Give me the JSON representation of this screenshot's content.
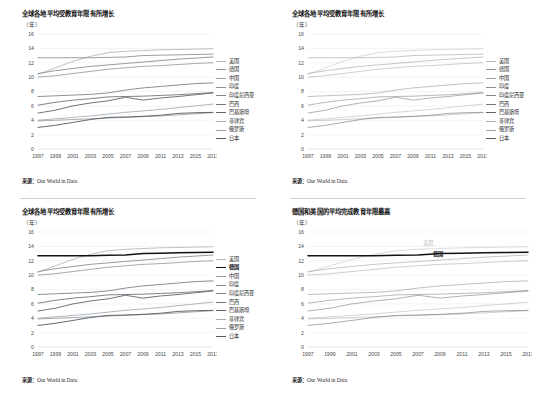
{
  "page": {
    "background": "#ffffff",
    "divider_color": "#c9cfd6"
  },
  "common": {
    "unit": "（年）",
    "source_label": "来源：",
    "source_text": "Our World in Data",
    "axis_ticks_y": [
      "16",
      "14",
      "12",
      "10",
      "8",
      "6",
      "4",
      "2",
      "0"
    ],
    "axis_ticks_x": [
      "1997",
      "1999",
      "2001",
      "2003",
      "2005",
      "2007",
      "2009",
      "2011",
      "2013",
      "2015",
      "2017"
    ]
  },
  "panels": [
    {
      "id": "panel-top-left",
      "title": "全球各地平均受教育年限有所增长",
      "legend_position": "right",
      "highlight": null
    },
    {
      "id": "panel-top-right",
      "title": "全球各地平均受教育年限有所增长",
      "legend_position": "right",
      "highlight": null
    },
    {
      "id": "panel-bottom-left",
      "title": "全球各地平均受教育年限有所增长",
      "legend_position": "right",
      "highlight": "德国"
    },
    {
      "id": "panel-bottom-right",
      "title": "德国和美国的平均完成教育年限最高",
      "legend_position": "inline",
      "highlight": "德国",
      "inline_labels": [
        {
          "name": "美国",
          "color": "#b9bec4"
        },
        {
          "name": "德国",
          "color": "#1a1a1a"
        }
      ]
    }
  ],
  "chart_data": {
    "type": "line",
    "title": "全球各地平均受教育年限有所增长",
    "subtitle": "德国和美国的平均完成教育年限最高",
    "xlabel": "",
    "ylabel": "（年）",
    "ylim": [
      0,
      16
    ],
    "xlim": [
      1997,
      2017
    ],
    "grid": true,
    "legend_position": "right",
    "x": [
      1997,
      1999,
      2001,
      2003,
      2005,
      2007,
      2009,
      2011,
      2013,
      2015,
      2017
    ],
    "series": [
      {
        "name": "美国",
        "color": "#b4b9bf",
        "values": [
          10.4,
          11.3,
          12.2,
          12.9,
          13.4,
          13.6,
          13.7,
          13.8,
          13.85,
          13.9,
          13.95
        ]
      },
      {
        "name": "德国",
        "color": "#8d949b",
        "values": [
          12.7,
          12.7,
          12.7,
          12.7,
          12.75,
          12.8,
          13.0,
          13.05,
          13.1,
          13.15,
          13.2
        ]
      },
      {
        "name": "中国",
        "color": "#9aa0a6",
        "values": [
          10.0,
          10.2,
          10.5,
          10.8,
          11.1,
          11.3,
          11.5,
          11.6,
          11.75,
          11.9,
          12.0
        ]
      },
      {
        "name": "印度",
        "color": "#8a9096",
        "values": [
          10.5,
          10.9,
          11.2,
          11.5,
          11.7,
          11.9,
          12.1,
          12.3,
          12.5,
          12.65,
          12.8
        ]
      },
      {
        "name": "印度尼西亚",
        "color": "#7d838a",
        "values": [
          7.3,
          7.4,
          7.5,
          7.6,
          7.8,
          8.2,
          8.5,
          8.7,
          8.9,
          9.1,
          9.2
        ]
      },
      {
        "name": "巴西",
        "color": "#6f757c",
        "values": [
          6.1,
          6.5,
          6.8,
          7.0,
          7.25,
          7.3,
          7.35,
          7.45,
          7.55,
          7.7,
          7.85
        ]
      },
      {
        "name": "巴基斯坦",
        "color": "#60666d",
        "values": [
          5.0,
          5.4,
          6.0,
          6.4,
          6.7,
          7.2,
          6.8,
          7.1,
          7.3,
          7.55,
          7.8
        ]
      },
      {
        "name": "菲律宾",
        "color": "#a8aeb4",
        "values": [
          4.0,
          4.2,
          4.4,
          4.6,
          4.85,
          5.1,
          5.3,
          5.5,
          5.75,
          6.0,
          6.25
        ]
      },
      {
        "name": "俄罗斯",
        "color": "#9da3a9",
        "values": [
          3.9,
          4.0,
          4.1,
          4.2,
          4.3,
          4.4,
          4.5,
          4.6,
          4.75,
          4.9,
          5.05
        ]
      },
      {
        "name": "日本",
        "color": "#555b61",
        "values": [
          3.0,
          3.3,
          3.7,
          4.1,
          4.4,
          4.45,
          4.55,
          4.7,
          4.95,
          5.05,
          5.1
        ]
      }
    ]
  }
}
